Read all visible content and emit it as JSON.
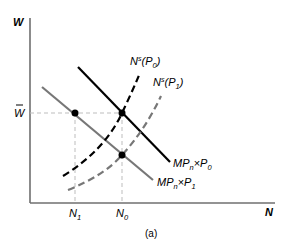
{
  "figure": {
    "caption": "(a)",
    "y_axis_label": "W",
    "x_axis_label": "N",
    "wage_label": "W̄",
    "wage_label_base": "W",
    "ticks": {
      "n1": {
        "base": "N",
        "sub": "1"
      },
      "n0": {
        "base": "N",
        "sub": "0"
      }
    },
    "curves": {
      "labor_supply_p0": {
        "base": "N",
        "sup": "s",
        "open": "(",
        "p": "P",
        "p_sub": "0",
        "close": ")",
        "style": "dashed",
        "color": "#000000"
      },
      "labor_supply_p1": {
        "base": "N",
        "sup": "s",
        "open": "(",
        "p": "P",
        "p_sub": "1",
        "close": ")",
        "style": "dashed",
        "color": "#777777"
      },
      "labor_demand_p0": {
        "mp": "MP",
        "mp_sub": "n",
        "times": "×",
        "p": "P",
        "p_sub": "0",
        "style": "solid",
        "color": "#000000"
      },
      "labor_demand_p1": {
        "mp": "MP",
        "mp_sub": "n",
        "times": "×",
        "p": "P",
        "p_sub": "1",
        "style": "solid",
        "color": "#777777"
      }
    },
    "equilibrium_points": [
      {
        "name": "N1 at W-bar",
        "x": "N1",
        "y": "W̄"
      },
      {
        "name": "N0 at W-bar",
        "x": "N0",
        "y": "W̄"
      },
      {
        "name": "N0 at MPn×P1",
        "x": "N0",
        "y": "below W̄"
      }
    ],
    "colors": {
      "axis": "#6f6f6f",
      "black": "#000000",
      "gray": "#777777",
      "guide": "#bdbdbd"
    }
  }
}
